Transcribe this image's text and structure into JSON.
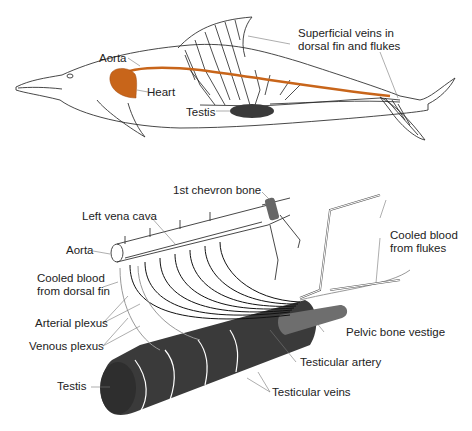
{
  "colors": {
    "outline": "#333333",
    "aorta_heart": "#c8651a",
    "testis": "#3a3a3a",
    "pelvic_bone": "#6e6e6e",
    "chevron_bone": "#666666",
    "background": "#ffffff"
  },
  "top_panel": {
    "labels": {
      "superficial_veins": [
        "Superficial veins in",
        "dorsal fin and flukes"
      ],
      "aorta": "Aorta",
      "heart": "Heart",
      "testis": "Testis"
    }
  },
  "bottom_panel": {
    "labels": {
      "first_chevron_bone": "1st chevron bone",
      "left_vena_cava": "Left vena cava",
      "aorta": "Aorta",
      "cooled_blood_dorsal_fin": [
        "Cooled blood",
        "from dorsal fin"
      ],
      "arterial_plexus": "Arterial plexus",
      "venous_plexus": "Venous plexus",
      "testis": "Testis",
      "cooled_blood_flukes": [
        "Cooled blood",
        "from flukes"
      ],
      "pelvic_bone_vestige": "Pelvic bone vestige",
      "testicular_artery": "Testicular artery",
      "testicular_veins": "Testicular veins"
    }
  }
}
